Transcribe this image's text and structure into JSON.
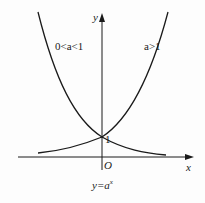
{
  "diagram": {
    "axes": {
      "x_label": "x",
      "y_label": "y",
      "origin_label": "O",
      "y_intercept_label": "1"
    },
    "curves": [
      {
        "name": "decreasing",
        "label": "0<a<1"
      },
      {
        "name": "increasing",
        "label": "a>1"
      }
    ],
    "caption": "y=a",
    "caption_superscript": "x",
    "colors": {
      "stroke": "#1a1a1a",
      "background": "#fdfdfd"
    }
  }
}
